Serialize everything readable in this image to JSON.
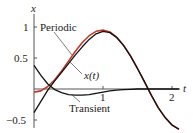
{
  "chart_data": {
    "type": "line",
    "title": "",
    "xlabel": "t",
    "ylabel": "x",
    "xlim": [
      0,
      2.2
    ],
    "ylim": [
      -0.6,
      1.1
    ],
    "xticks": [
      "1",
      "2"
    ],
    "yticks": [
      "1",
      "0.5",
      "-0.5"
    ],
    "grid": false,
    "legend": "annotations",
    "annotations": [
      "Periodic",
      "x(t)",
      "Transient"
    ],
    "x": [
      0,
      0.1,
      0.2,
      0.3,
      0.4,
      0.5,
      0.6,
      0.7,
      0.8,
      0.9,
      1.0,
      1.1,
      1.2,
      1.3,
      1.4,
      1.5,
      1.6,
      1.7,
      1.8,
      1.9,
      2.0,
      2.1
    ],
    "series": [
      {
        "name": "Periodic",
        "color": "#c0392b",
        "values": [
          -0.05,
          -0.03,
          0.04,
          0.15,
          0.29,
          0.45,
          0.61,
          0.75,
          0.86,
          0.93,
          0.95,
          0.92,
          0.83,
          0.7,
          0.53,
          0.33,
          0.12,
          -0.1,
          -0.3,
          -0.46,
          -0.58,
          -0.65
        ]
      },
      {
        "name": "x(t)",
        "color": "#111111",
        "values": [
          -0.38,
          -0.2,
          -0.02,
          0.13,
          0.27,
          0.41,
          0.55,
          0.68,
          0.8,
          0.89,
          0.93,
          0.91,
          0.83,
          0.7,
          0.53,
          0.33,
          0.12,
          -0.1,
          -0.3,
          -0.46,
          -0.58,
          -0.65
        ]
      },
      {
        "name": "Transient",
        "color": "#111111",
        "values": [
          0.38,
          0.22,
          0.08,
          -0.01,
          -0.06,
          -0.09,
          -0.1,
          -0.1,
          -0.09,
          -0.07,
          -0.05,
          -0.03,
          -0.02,
          -0.01,
          -0.005,
          0,
          0,
          0,
          0,
          0,
          0,
          0
        ]
      }
    ]
  },
  "labels": {
    "y_axis": "x",
    "x_axis": "t",
    "tick_1y": "1",
    "tick_05": "0.5",
    "tick_m05": "−0.5",
    "tick_1x": "1",
    "tick_2x": "2",
    "periodic": "Periodic",
    "xt": "x(t)",
    "transient": "Transient"
  }
}
